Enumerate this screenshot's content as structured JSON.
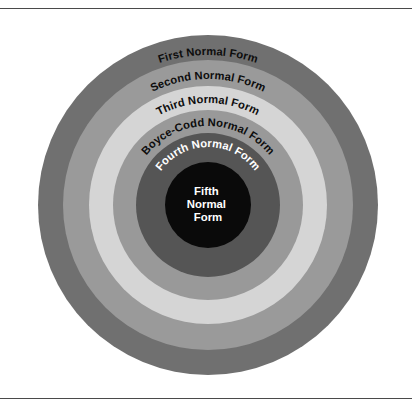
{
  "figure": {
    "name": "normal-forms-nested-circles",
    "background_color": "#ffffff",
    "rule_color": "#4a4a4a",
    "center": {
      "x": 208,
      "y": 205
    },
    "rings": [
      {
        "id": "first-normal-form",
        "label": "First Normal Form",
        "radius": 170,
        "color": "#707070",
        "text_color": "#0d0d0d",
        "label_radius": 150
      },
      {
        "id": "second-normal-form",
        "label": "Second Normal Form",
        "radius": 145,
        "color": "#9a9a9a",
        "text_color": "#0d0d0d",
        "label_radius": 126
      },
      {
        "id": "third-normal-form",
        "label": "Third Normal Form",
        "radius": 119,
        "color": "#d5d5d5",
        "text_color": "#0d0d0d",
        "label_radius": 102
      },
      {
        "id": "boyce-codd-normal-form",
        "label": "Boyce-Codd Normal Form",
        "radius": 95,
        "color": "#999999",
        "text_color": "#0d0d0d",
        "label_radius": 79
      },
      {
        "id": "fourth-normal-form",
        "label": "Fourth Normal Form",
        "radius": 72,
        "color": "#555555",
        "text_color": "#ffffff",
        "label_radius": 58
      }
    ],
    "core": {
      "id": "fifth-normal-form",
      "radius": 43,
      "color": "#0a0a0a",
      "text_color": "#ffffff",
      "lines": [
        "Fifth",
        "Normal",
        "Form"
      ]
    }
  }
}
